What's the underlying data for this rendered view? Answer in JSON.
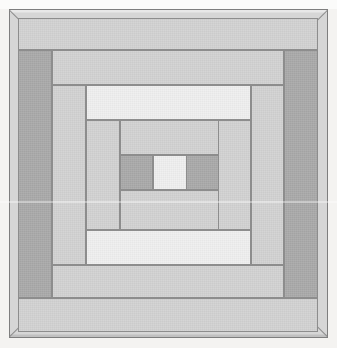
{
  "artwork": {
    "title": "Nested Concentric Frames",
    "width": 337,
    "height": 348,
    "background_color": "#f4f3f1",
    "seam_color": "#8d8d8d",
    "palette": {
      "dark_gray": "#a9a9a9",
      "mid_gray": "#c4c4c4",
      "light_gray": "#d2d2d2",
      "pale_gray": "#dcdcdc",
      "near_white": "#efefef",
      "frame_gray": "#d6d6d6"
    },
    "frame": {
      "label": "outer-mitered-frame",
      "x": 9,
      "y": 9,
      "width": 319,
      "height": 329,
      "color": "#d6d6d6",
      "corner_style": "mitered"
    },
    "rings": [
      {
        "index": 1,
        "label": "ring-1",
        "bounds": {
          "x": 18,
          "y": 18,
          "width": 300,
          "height": 314
        },
        "bands": [
          {
            "name": "ring-1-top",
            "x": 18,
            "y": 18,
            "width": 300,
            "height": 32,
            "tone": "light"
          },
          {
            "name": "ring-1-bottom",
            "x": 18,
            "y": 298,
            "width": 300,
            "height": 34,
            "tone": "light"
          },
          {
            "name": "ring-1-left",
            "x": 18,
            "y": 50,
            "width": 34,
            "height": 248,
            "tone": "dark"
          },
          {
            "name": "ring-1-right",
            "x": 284,
            "y": 50,
            "width": 34,
            "height": 248,
            "tone": "dark"
          }
        ]
      },
      {
        "index": 2,
        "label": "ring-2",
        "bounds": {
          "x": 52,
          "y": 50,
          "width": 232,
          "height": 248
        },
        "bands": [
          {
            "name": "ring-2-top",
            "x": 52,
            "y": 50,
            "width": 232,
            "height": 35,
            "tone": "light"
          },
          {
            "name": "ring-2-bottom",
            "x": 52,
            "y": 265,
            "width": 232,
            "height": 33,
            "tone": "light"
          },
          {
            "name": "ring-2-left",
            "x": 52,
            "y": 85,
            "width": 34,
            "height": 180,
            "tone": "light"
          },
          {
            "name": "ring-2-right",
            "x": 251,
            "y": 85,
            "width": 33,
            "height": 180,
            "tone": "light"
          }
        ]
      },
      {
        "index": 3,
        "label": "ring-3",
        "bounds": {
          "x": 86,
          "y": 85,
          "width": 165,
          "height": 180
        },
        "bands": [
          {
            "name": "ring-3-top",
            "x": 86,
            "y": 85,
            "width": 165,
            "height": 35,
            "tone": "white"
          },
          {
            "name": "ring-3-bottom",
            "x": 86,
            "y": 230,
            "width": 165,
            "height": 35,
            "tone": "white"
          },
          {
            "name": "ring-3-left",
            "x": 86,
            "y": 120,
            "width": 34,
            "height": 110,
            "tone": "light"
          },
          {
            "name": "ring-3-right",
            "x": 218,
            "y": 120,
            "width": 33,
            "height": 110,
            "tone": "light"
          }
        ]
      },
      {
        "index": 4,
        "label": "ring-4",
        "bounds": {
          "x": 120,
          "y": 120,
          "width": 99,
          "height": 110
        },
        "bands": [
          {
            "name": "ring-4-top",
            "x": 120,
            "y": 120,
            "width": 99,
            "height": 35,
            "tone": "light"
          },
          {
            "name": "ring-4-bottom",
            "x": 120,
            "y": 190,
            "width": 99,
            "height": 40,
            "tone": "light"
          },
          {
            "name": "ring-4-left",
            "x": 120,
            "y": 155,
            "width": 33,
            "height": 35,
            "tone": "dark"
          },
          {
            "name": "ring-4-right",
            "x": 186,
            "y": 155,
            "width": 33,
            "height": 35,
            "tone": "dark"
          }
        ]
      }
    ],
    "center": {
      "name": "center-square",
      "x": 153,
      "y": 155,
      "width": 34,
      "height": 35,
      "tone": "white"
    }
  }
}
